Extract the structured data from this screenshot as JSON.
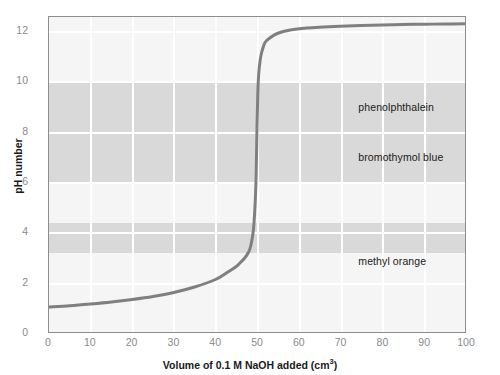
{
  "chart_data": {
    "type": "line",
    "title": "",
    "xlabel": "Volume of 0.1 M NaOH added (cm3)",
    "xlabel_main": "Volume of 0.1 M NaOH added (cm",
    "xlabel_sup": "3",
    "xlabel_tail": ")",
    "ylabel": "pH number",
    "xlim": [
      0,
      100
    ],
    "ylim": [
      0,
      12.6
    ],
    "xticks": [
      0,
      10,
      20,
      30,
      40,
      50,
      60,
      70,
      80,
      90,
      100
    ],
    "yticks": [
      0,
      2,
      4,
      6,
      8,
      10,
      12
    ],
    "grid": true,
    "legend": "none",
    "series": [
      {
        "name": "titration curve",
        "color": "#7f7f7f",
        "x": [
          0,
          5,
          10,
          15,
          20,
          25,
          30,
          35,
          40,
          43,
          45,
          46,
          47,
          48,
          48.5,
          49,
          49.3,
          49.6,
          49.8,
          50,
          50.2,
          50.4,
          50.7,
          51,
          51.5,
          52,
          53,
          55,
          58,
          62,
          66,
          70,
          75,
          80,
          85,
          90,
          95,
          100
        ],
        "y": [
          1.0,
          1.05,
          1.12,
          1.2,
          1.3,
          1.42,
          1.58,
          1.8,
          2.1,
          2.4,
          2.62,
          2.78,
          2.95,
          3.2,
          3.45,
          3.9,
          4.4,
          5.3,
          6.3,
          8.2,
          9.6,
          10.3,
          10.8,
          11.1,
          11.4,
          11.6,
          11.75,
          11.95,
          12.08,
          12.16,
          12.2,
          12.23,
          12.26,
          12.28,
          12.3,
          12.31,
          12.32,
          12.33
        ]
      }
    ],
    "indicator_bands": [
      {
        "name": "phenolphthalein",
        "label": "phenolphthalein",
        "ph_min": 8.0,
        "ph_max": 10.0,
        "color": "#d9d9d9",
        "label_ph": 9.0,
        "label_x": 74
      },
      {
        "name": "bromothymol blue",
        "label": "bromothymol blue",
        "ph_min": 6.0,
        "ph_max": 8.0,
        "color": "#d9d9d9",
        "label_ph": 7.0,
        "label_x": 74
      },
      {
        "name": "methyl orange",
        "label": "methyl orange",
        "ph_min": 3.2,
        "ph_max": 4.4,
        "color": "#d9d9d9",
        "label_ph": 2.85,
        "label_x": 74
      }
    ]
  },
  "axes": {
    "x_tick_labels": [
      "0",
      "10",
      "20",
      "30",
      "40",
      "50",
      "60",
      "70",
      "80",
      "90",
      "100"
    ],
    "y_tick_labels": [
      "0",
      "2",
      "4",
      "6",
      "8",
      "10",
      "12"
    ]
  }
}
